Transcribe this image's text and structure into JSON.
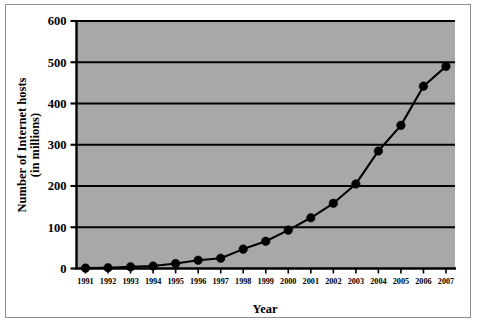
{
  "chart_data": {
    "type": "line",
    "title": "",
    "xlabel": "Year",
    "ylabel": "Number of Internet hosts (in millions)",
    "ylabel_line1": "Number of Internet hosts",
    "ylabel_line2": "(in millions)",
    "categories": [
      "1991",
      "1992",
      "1993",
      "1994",
      "1995",
      "1996",
      "1997",
      "1998",
      "1999",
      "2000",
      "2001",
      "2002",
      "2003",
      "2004",
      "2005",
      "2006",
      "2007"
    ],
    "values": [
      1,
      2,
      4,
      6,
      12,
      20,
      25,
      47,
      66,
      93,
      123,
      158,
      205,
      285,
      347,
      442,
      490
    ],
    "x": [
      1991,
      1992,
      1993,
      1994,
      1995,
      1996,
      1997,
      1998,
      1999,
      2000,
      2001,
      2002,
      2003,
      2004,
      2005,
      2006,
      2007
    ],
    "ylim": [
      0,
      600
    ],
    "xlim": [
      1990.6,
      2007.4
    ],
    "yticks": [
      0,
      100,
      200,
      300,
      400,
      500,
      600
    ],
    "ytick_labels": [
      "0",
      "100",
      "200",
      "300",
      "400",
      "500",
      "600"
    ],
    "xtick_labels": [
      "1991",
      "1992",
      "1993",
      "1994",
      "1995",
      "1996",
      "1997",
      "1998",
      "1999",
      "2000",
      "2001",
      "2002",
      "2003",
      "2004",
      "2005",
      "2006",
      "2007"
    ],
    "grid": true,
    "grid_axis": "y",
    "legend": false,
    "legend_position": "none",
    "series": [
      {
        "name": "Internet hosts",
        "values": [
          1,
          2,
          4,
          6,
          12,
          20,
          25,
          47,
          66,
          93,
          123,
          158,
          205,
          285,
          347,
          442,
          490
        ],
        "marker": "circle",
        "line_color": "#000000",
        "marker_color": "#000000"
      }
    ],
    "colors": {
      "plot_background": "#a8a8a8",
      "figure_background": "#ffffff",
      "axis": "#000000",
      "gridline": "#000000",
      "series": "#000000",
      "frame_border": "#8e8e8e"
    }
  }
}
